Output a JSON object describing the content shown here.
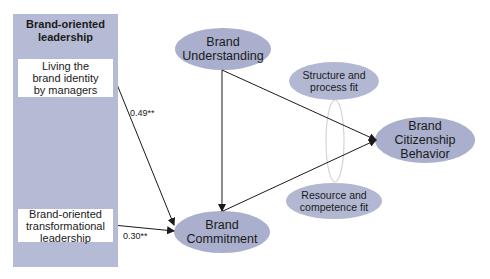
{
  "panel": {
    "title_line1": "Brand-oriented",
    "title_line2": "leadership",
    "fill": "#b5bbd4",
    "items": [
      {
        "line1": "Living the",
        "line2": "brand identity",
        "line3": "by managers"
      },
      {
        "line1": "Brand-oriented",
        "line2": "transformational",
        "line3": "leadership"
      }
    ]
  },
  "nodes": {
    "brand_understanding": {
      "line1": "Brand",
      "line2": "Understanding"
    },
    "brand_commitment": {
      "line1": "Brand",
      "line2": "Commitment"
    },
    "brand_citizenship_behavior": {
      "line1": "Brand",
      "line2": "Citizenship",
      "line3": "Behavior"
    },
    "structure_fit": {
      "line1": "Structure and",
      "line2": "process fit"
    },
    "resource_fit": {
      "line1": "Resource and",
      "line2": "competence fit"
    }
  },
  "paths": [
    {
      "from": "Living the brand identity by managers",
      "to": "Brand Commitment",
      "coefficient": "0.49**"
    },
    {
      "from": "Brand-oriented transformational leadership",
      "to": "Brand Commitment",
      "coefficient": "0.30**"
    },
    {
      "from": "Brand Understanding",
      "to": "Brand Commitment",
      "coefficient": ""
    },
    {
      "from": "Brand Understanding",
      "to": "Brand Citizenship Behavior",
      "coefficient": ""
    },
    {
      "from": "Brand Commitment",
      "to": "Brand Citizenship Behavior",
      "coefficient": ""
    }
  ],
  "colors": {
    "node_fill": "#a9afcc",
    "moderator_outline": "#d4d4d4",
    "arrow": "#1a1a1a"
  }
}
